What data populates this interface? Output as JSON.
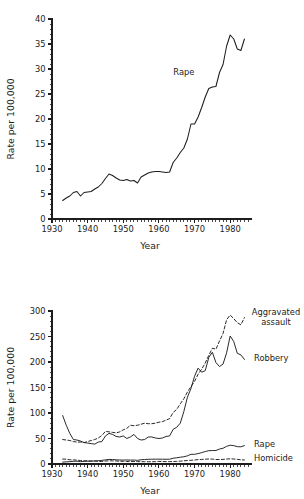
{
  "chart_data": [
    {
      "id": "top",
      "type": "line",
      "title": "",
      "xlabel": "Year",
      "ylabel": "Rate per 100,000",
      "xlim": [
        1930,
        1985
      ],
      "ylim": [
        0,
        40
      ],
      "xticks": [
        1930,
        1940,
        1950,
        1960,
        1970,
        1980
      ],
      "xticklabels": [
        "1930",
        "1940",
        "1950",
        "1960",
        "1970",
        "1980"
      ],
      "yticks": [
        0,
        5,
        10,
        15,
        20,
        25,
        30,
        35,
        40
      ],
      "yticklabels": [
        "0",
        "5",
        "10",
        "15",
        "20",
        "25",
        "30",
        "35",
        "40"
      ],
      "minor_x_step": 1,
      "minor_y_step": 1,
      "grid": false,
      "legend_position": "inline-annotation",
      "annotations": [
        {
          "text": "Rape",
          "x": 1967,
          "y": 29.5
        }
      ],
      "series": [
        {
          "name": "Rape",
          "style": "solid",
          "x": [
            1933,
            1934,
            1935,
            1936,
            1937,
            1938,
            1939,
            1940,
            1941,
            1942,
            1943,
            1944,
            1945,
            1946,
            1947,
            1948,
            1949,
            1950,
            1951,
            1952,
            1953,
            1954,
            1955,
            1956,
            1957,
            1958,
            1959,
            1960,
            1961,
            1962,
            1963,
            1964,
            1965,
            1966,
            1967,
            1968,
            1969,
            1970,
            1971,
            1972,
            1973,
            1974,
            1975,
            1976,
            1977,
            1978,
            1979,
            1980,
            1981,
            1982,
            1983,
            1984
          ],
          "values": [
            3.7,
            4.2,
            4.6,
            5.3,
            5.5,
            4.6,
            5.3,
            5.4,
            5.5,
            6.0,
            6.4,
            7.1,
            8.1,
            9.0,
            8.7,
            8.2,
            7.8,
            7.7,
            7.9,
            7.6,
            7.7,
            7.2,
            8.4,
            8.8,
            9.2,
            9.4,
            9.5,
            9.5,
            9.4,
            9.3,
            9.4,
            11.3,
            12.2,
            13.3,
            14.2,
            16.0,
            19.0,
            19.0,
            20.4,
            22.3,
            24.4,
            26.1,
            26.4,
            26.5,
            29.3,
            30.9,
            34.6,
            36.8,
            36.0,
            34.0,
            33.7,
            36.0
          ]
        }
      ]
    },
    {
      "id": "bottom",
      "type": "line",
      "title": "",
      "xlabel": "Year",
      "ylabel": "Rate per 100,000",
      "xlim": [
        1930,
        1985
      ],
      "ylim": [
        0,
        300
      ],
      "xticks": [
        1930,
        1940,
        1950,
        1960,
        1970,
        1980
      ],
      "xticklabels": [
        "1930",
        "1940",
        "1950",
        "1960",
        "1970",
        "1980"
      ],
      "yticks": [
        0,
        50,
        100,
        150,
        200,
        250,
        300
      ],
      "yticklabels": [
        "0",
        "50",
        "100",
        "150",
        "200",
        "250",
        "300"
      ],
      "minor_x_step": 1,
      "minor_y_step": 10,
      "grid": false,
      "legend_position": "right-inline",
      "annotations": [
        {
          "text": "Aggravated assault",
          "lines": [
            "Aggravated",
            "assault"
          ],
          "x": 1986,
          "y": 292
        },
        {
          "text": "Robbery",
          "x": 1986,
          "y": 208
        },
        {
          "text": "Rape",
          "x": 1986,
          "y": 40
        },
        {
          "text": "Homicide",
          "x": 1986,
          "y": 11
        }
      ],
      "series": [
        {
          "name": "Aggravated assault",
          "style": "dashed",
          "x": [
            1933,
            1934,
            1935,
            1936,
            1937,
            1938,
            1939,
            1940,
            1941,
            1942,
            1943,
            1944,
            1945,
            1946,
            1947,
            1948,
            1949,
            1950,
            1951,
            1952,
            1953,
            1954,
            1955,
            1956,
            1957,
            1958,
            1959,
            1960,
            1961,
            1962,
            1963,
            1964,
            1965,
            1966,
            1967,
            1968,
            1969,
            1970,
            1971,
            1972,
            1973,
            1974,
            1975,
            1976,
            1977,
            1978,
            1979,
            1980,
            1981,
            1982,
            1983,
            1984
          ],
          "values": [
            48,
            47,
            46,
            44,
            43,
            43,
            42,
            44,
            46,
            48,
            51,
            56,
            64,
            63,
            62,
            61,
            63,
            67,
            70,
            76,
            75,
            76,
            78,
            80,
            79,
            79,
            80,
            82,
            83,
            86,
            89,
            101,
            107,
            118,
            128,
            141,
            152,
            162,
            176,
            186,
            198,
            213,
            227,
            225,
            241,
            256,
            283,
            292,
            285,
            277,
            273,
            287
          ]
        },
        {
          "name": "Robbery",
          "style": "solid",
          "x": [
            1933,
            1934,
            1935,
            1936,
            1937,
            1938,
            1939,
            1940,
            1941,
            1942,
            1943,
            1944,
            1945,
            1946,
            1947,
            1948,
            1949,
            1950,
            1951,
            1952,
            1953,
            1954,
            1955,
            1956,
            1957,
            1958,
            1959,
            1960,
            1961,
            1962,
            1963,
            1964,
            1965,
            1966,
            1967,
            1968,
            1969,
            1970,
            1971,
            1972,
            1973,
            1974,
            1975,
            1976,
            1977,
            1978,
            1979,
            1980,
            1981,
            1982,
            1983,
            1984
          ],
          "values": [
            95,
            76,
            60,
            48,
            47,
            45,
            42,
            41,
            40,
            39,
            43,
            44,
            55,
            60,
            58,
            54,
            53,
            55,
            50,
            53,
            58,
            50,
            47,
            48,
            53,
            53,
            51,
            50,
            51,
            54,
            55,
            68,
            72,
            80,
            103,
            131,
            148,
            172,
            188,
            180,
            183,
            209,
            219,
            199,
            191,
            196,
            218,
            251,
            240,
            217,
            214,
            205
          ]
        },
        {
          "name": "Rape",
          "style": "solid",
          "x": [
            1933,
            1934,
            1935,
            1936,
            1937,
            1938,
            1939,
            1940,
            1941,
            1942,
            1943,
            1944,
            1945,
            1946,
            1947,
            1948,
            1949,
            1950,
            1951,
            1952,
            1953,
            1954,
            1955,
            1956,
            1957,
            1958,
            1959,
            1960,
            1961,
            1962,
            1963,
            1964,
            1965,
            1966,
            1967,
            1968,
            1969,
            1970,
            1971,
            1972,
            1973,
            1974,
            1975,
            1976,
            1977,
            1978,
            1979,
            1980,
            1981,
            1982,
            1983,
            1984
          ],
          "values": [
            3.7,
            4.2,
            4.6,
            5.3,
            5.5,
            4.6,
            5.3,
            5.4,
            5.5,
            6.0,
            6.4,
            7.1,
            8.1,
            9.0,
            8.7,
            8.2,
            7.8,
            7.7,
            7.9,
            7.6,
            7.7,
            7.2,
            8.4,
            8.8,
            9.2,
            9.4,
            9.5,
            9.5,
            9.4,
            9.3,
            9.4,
            11.3,
            12.2,
            13.3,
            14.2,
            16.0,
            19.0,
            19.0,
            20.4,
            22.3,
            24.4,
            26.1,
            26.4,
            26.5,
            29.3,
            30.9,
            34.6,
            36.8,
            36.0,
            34.0,
            33.7,
            36.0
          ]
        },
        {
          "name": "Homicide",
          "style": "dashed",
          "x": [
            1933,
            1934,
            1935,
            1936,
            1937,
            1938,
            1939,
            1940,
            1941,
            1942,
            1943,
            1944,
            1945,
            1946,
            1947,
            1948,
            1949,
            1950,
            1951,
            1952,
            1953,
            1954,
            1955,
            1956,
            1957,
            1958,
            1959,
            1960,
            1961,
            1962,
            1963,
            1964,
            1965,
            1966,
            1967,
            1968,
            1969,
            1970,
            1971,
            1972,
            1973,
            1974,
            1975,
            1976,
            1977,
            1978,
            1979,
            1980,
            1981,
            1982,
            1983,
            1984
          ],
          "values": [
            9.7,
            9.5,
            8.3,
            8.0,
            7.6,
            6.8,
            6.4,
            6.3,
            6.0,
            5.9,
            5.1,
            5.0,
            5.7,
            6.4,
            6.1,
            5.9,
            5.4,
            5.3,
            4.9,
            5.2,
            4.8,
            4.8,
            4.5,
            4.6,
            4.5,
            4.5,
            4.6,
            5.1,
            4.8,
            4.6,
            4.6,
            4.9,
            5.1,
            5.6,
            6.2,
            6.9,
            7.3,
            7.9,
            8.6,
            9.0,
            9.4,
            9.8,
            9.6,
            8.8,
            8.8,
            9.0,
            9.7,
            10.2,
            9.8,
            9.1,
            8.3,
            7.9
          ]
        }
      ]
    }
  ],
  "figure": {
    "background": "#ffffff",
    "ink_color": "#1d1d1d"
  }
}
